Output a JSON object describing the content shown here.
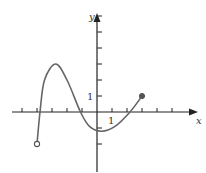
{
  "chart_data": {
    "type": "line",
    "title": "",
    "xlabel": "x",
    "ylabel": "y",
    "xlim": [
      -6,
      7
    ],
    "ylim": [
      -3.5,
      7
    ],
    "grid": false,
    "tick_label_x": "1",
    "tick_label_y": "1",
    "x_ticks": [
      -5,
      -4,
      -3,
      -2,
      -1,
      1,
      2,
      3,
      4,
      5
    ],
    "y_ticks": [
      -2,
      -1,
      1,
      2,
      3,
      4,
      5,
      6
    ],
    "series": [
      {
        "name": "f(x)",
        "points": [
          [
            -4,
            -2
          ],
          [
            -3.8,
            0
          ],
          [
            -3.5,
            2
          ],
          [
            -2.75,
            3
          ],
          [
            -2,
            2
          ],
          [
            -1.1,
            0
          ],
          [
            -0.5,
            -0.9
          ],
          [
            0.3,
            -1.2
          ],
          [
            1.2,
            -0.9
          ],
          [
            2.2,
            0
          ],
          [
            3,
            1
          ]
        ],
        "start": {
          "x": -4,
          "y": -2,
          "type": "open"
        },
        "end": {
          "x": 3,
          "y": 1,
          "type": "closed"
        }
      }
    ],
    "colors": {
      "axis": "#222222",
      "curve": "#666666"
    }
  }
}
